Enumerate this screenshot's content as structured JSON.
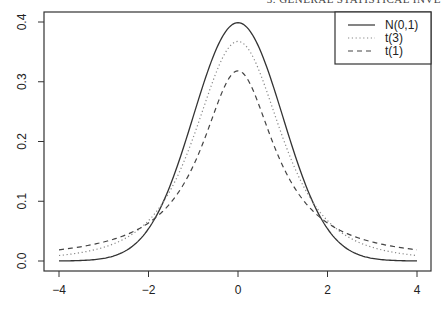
{
  "page": {
    "running_header": "3. GENERAL STATISTICAL INVE"
  },
  "chart_data": {
    "type": "line",
    "title": "",
    "xlabel": "",
    "ylabel": "",
    "xlim": [
      -4,
      4
    ],
    "ylim": [
      0,
      0.4
    ],
    "x_ticks": [
      "-4",
      "-2",
      "0",
      "2",
      "4"
    ],
    "y_ticks": [
      "0.0",
      "0.1",
      "0.2",
      "0.3",
      "0.4"
    ],
    "grid": false,
    "legend_position": "top-right",
    "series": [
      {
        "name": "N(0,1)",
        "style": "solid",
        "color": "#333333",
        "x": [
          -4,
          -3,
          -2,
          -1,
          0,
          1,
          2,
          3,
          4
        ],
        "values": [
          0.0001,
          0.0044,
          0.054,
          0.242,
          0.399,
          0.242,
          0.054,
          0.0044,
          0.0001
        ]
      },
      {
        "name": "t(3)",
        "style": "dotted",
        "color": "#888888",
        "x": [
          -4,
          -3,
          -2,
          -1,
          0,
          1,
          2,
          3,
          4
        ],
        "values": [
          0.0042,
          0.0229,
          0.0675,
          0.2067,
          0.3676,
          0.2067,
          0.0675,
          0.0229,
          0.0042
        ]
      },
      {
        "name": "t(1)",
        "style": "dashed",
        "color": "#444444",
        "x": [
          -4,
          -3,
          -2,
          -1,
          0,
          1,
          2,
          3,
          4
        ],
        "values": [
          0.0187,
          0.0318,
          0.0637,
          0.1592,
          0.3183,
          0.1592,
          0.0637,
          0.0318,
          0.0187
        ]
      }
    ]
  }
}
